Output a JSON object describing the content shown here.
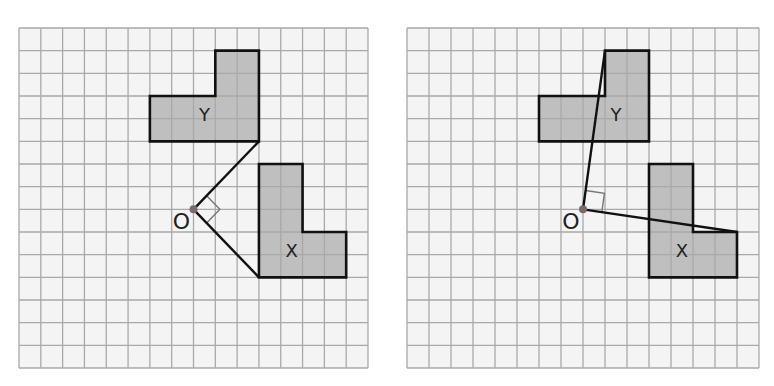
{
  "colors": {
    "background": "#f4f4f4",
    "grid_line": "#a9a9a9",
    "shape_fill": "#bfbfbf",
    "outline": "#111111",
    "origin_dot": "#7c6a6a",
    "right_angle_marker": "#777777"
  },
  "grid": {
    "cols": 16,
    "rows": 15
  },
  "panels": [
    {
      "id": "left",
      "x0": 18,
      "y0": 27,
      "width": 349,
      "height": 340,
      "shapes": [
        {
          "label": "Y",
          "points": [
            [
              9,
              1
            ],
            [
              11,
              1
            ],
            [
              11,
              5
            ],
            [
              6,
              5
            ],
            [
              6,
              3
            ],
            [
              9,
              3
            ]
          ],
          "label_pos": [
            8.5,
            4.1
          ]
        },
        {
          "label": "X",
          "points": [
            [
              11,
              6
            ],
            [
              13,
              6
            ],
            [
              13,
              9
            ],
            [
              15,
              9
            ],
            [
              15,
              11
            ],
            [
              11,
              11
            ]
          ],
          "label_pos": [
            12.5,
            10.1
          ]
        }
      ],
      "origin": {
        "label": "O",
        "point": [
          8,
          8
        ]
      },
      "rays": [
        [
          [
            8,
            8
          ],
          [
            11,
            5
          ]
        ],
        [
          [
            8,
            8
          ],
          [
            11,
            11
          ]
        ]
      ],
      "right_angle": true
    },
    {
      "id": "right",
      "x0": 406,
      "y0": 27,
      "width": 352,
      "height": 340,
      "shapes": [
        {
          "label": "Y",
          "points": [
            [
              9,
              1
            ],
            [
              11,
              1
            ],
            [
              11,
              5
            ],
            [
              6,
              5
            ],
            [
              6,
              3
            ],
            [
              9,
              3
            ]
          ],
          "label_pos": [
            9.5,
            4.1
          ]
        },
        {
          "label": "X",
          "points": [
            [
              11,
              6
            ],
            [
              13,
              6
            ],
            [
              13,
              9
            ],
            [
              15,
              9
            ],
            [
              15,
              11
            ],
            [
              11,
              11
            ]
          ],
          "label_pos": [
            12.5,
            10.1
          ]
        }
      ],
      "origin": {
        "label": "O",
        "point": [
          8,
          8
        ]
      },
      "rays": [
        [
          [
            8,
            8
          ],
          [
            9,
            1
          ]
        ],
        [
          [
            8,
            8
          ],
          [
            15,
            9
          ]
        ]
      ],
      "right_angle": true
    }
  ]
}
